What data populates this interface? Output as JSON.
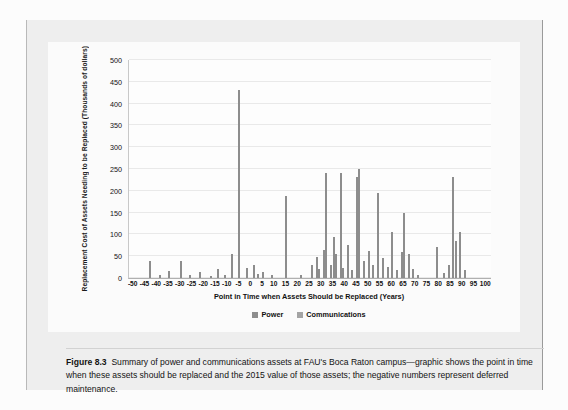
{
  "figure": {
    "label": "Figure 8.3",
    "caption": "Summary of power and communications assets at FAU's Boca Raton campus—graphic shows the point in time when these assets should be replaced and the 2015 value of those assets; the negative numbers represent deferred maintenance."
  },
  "chart_data": {
    "type": "bar",
    "title": "",
    "xlabel": "Point in Time when Assets Should be Replaced (Years)",
    "ylabel": "Replacement Cost of Assets Needing to be Replaced (Thousands of dollars)",
    "xlim": [
      -52,
      102
    ],
    "ylim": [
      0,
      500
    ],
    "ytick_values": [
      0,
      50,
      100,
      150,
      200,
      250,
      300,
      350,
      400,
      450,
      500
    ],
    "xtick_values": [
      -50,
      -45,
      -40,
      -35,
      -30,
      -25,
      -20,
      -15,
      -10,
      -5,
      0,
      5,
      10,
      15,
      20,
      25,
      30,
      35,
      40,
      45,
      50,
      55,
      60,
      65,
      70,
      75,
      80,
      85,
      90,
      95,
      100
    ],
    "grid": "horizontal",
    "legend_position": "bottom",
    "colors": {
      "power": "#8d8d8d",
      "communications": "#a4a4a4"
    },
    "legend": [
      {
        "name": "Power",
        "color": "#8d8d8d"
      },
      {
        "name": "Communications",
        "color": "#a4a4a4"
      }
    ],
    "series": [
      {
        "name": "Power",
        "points": [
          {
            "x": -43,
            "y": 40
          },
          {
            "x": -39,
            "y": 8
          },
          {
            "x": -35,
            "y": 17
          },
          {
            "x": -30,
            "y": 38
          },
          {
            "x": -26,
            "y": 6
          },
          {
            "x": -22,
            "y": 14
          },
          {
            "x": -17,
            "y": 5
          },
          {
            "x": -14,
            "y": 20
          },
          {
            "x": -11,
            "y": 8
          },
          {
            "x": -8,
            "y": 55
          },
          {
            "x": -5,
            "y": 432
          },
          {
            "x": -2,
            "y": 22
          },
          {
            "x": 1,
            "y": 30
          },
          {
            "x": 3,
            "y": 10
          },
          {
            "x": 5,
            "y": 14
          },
          {
            "x": 9,
            "y": 8
          },
          {
            "x": 15,
            "y": 188
          },
          {
            "x": 21,
            "y": 6
          },
          {
            "x": 26,
            "y": 30
          },
          {
            "x": 28,
            "y": 48
          },
          {
            "x": 29,
            "y": 20
          },
          {
            "x": 31,
            "y": 65
          },
          {
            "x": 32,
            "y": 240
          },
          {
            "x": 34,
            "y": 30
          },
          {
            "x": 35,
            "y": 95
          },
          {
            "x": 36,
            "y": 55
          },
          {
            "x": 38,
            "y": 240
          },
          {
            "x": 39,
            "y": 22
          },
          {
            "x": 41,
            "y": 75
          },
          {
            "x": 43,
            "y": 18
          },
          {
            "x": 45,
            "y": 232
          },
          {
            "x": 46,
            "y": 250
          },
          {
            "x": 48,
            "y": 40
          },
          {
            "x": 50,
            "y": 62
          },
          {
            "x": 52,
            "y": 30
          },
          {
            "x": 54,
            "y": 196
          },
          {
            "x": 56,
            "y": 45
          },
          {
            "x": 58,
            "y": 25
          },
          {
            "x": 60,
            "y": 105
          },
          {
            "x": 62,
            "y": 18
          },
          {
            "x": 64,
            "y": 60
          },
          {
            "x": 65,
            "y": 150
          },
          {
            "x": 67,
            "y": 55
          },
          {
            "x": 69,
            "y": 20
          },
          {
            "x": 71,
            "y": 8
          },
          {
            "x": 79,
            "y": 70
          },
          {
            "x": 82,
            "y": 12
          },
          {
            "x": 84,
            "y": 30
          },
          {
            "x": 86,
            "y": 232
          },
          {
            "x": 87,
            "y": 85
          },
          {
            "x": 89,
            "y": 105
          },
          {
            "x": 91,
            "y": 18
          }
        ]
      }
    ]
  }
}
